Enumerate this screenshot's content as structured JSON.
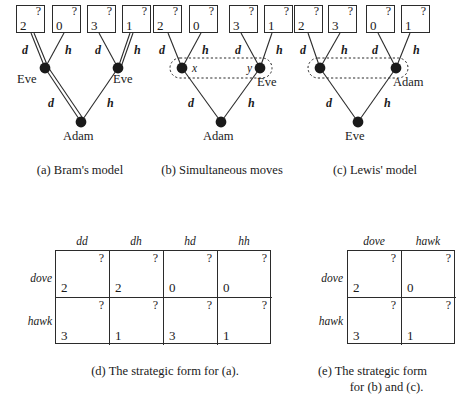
{
  "figure": {
    "trees": [
      {
        "id": "brams-model",
        "caption": "(a) Bram's model",
        "payoffs": [
          {
            "question": "?",
            "value": "2"
          },
          {
            "question": "?",
            "value": "0"
          },
          {
            "question": "?",
            "value": "3"
          },
          {
            "question": "?",
            "value": "1"
          }
        ],
        "edge_labels": [
          "d",
          "h",
          "d",
          "h"
        ],
        "root_edge_labels": [
          "d",
          "h"
        ],
        "upper_node_labels": [
          "Eve",
          "Eve"
        ],
        "root_node_label": "Adam",
        "information_set": false,
        "iset_labels": []
      },
      {
        "id": "simultaneous-moves",
        "caption": "(b) Simultaneous moves",
        "payoffs": [
          {
            "question": "?",
            "value": "2"
          },
          {
            "question": "?",
            "value": "0"
          },
          {
            "question": "?",
            "value": "3"
          },
          {
            "question": "?",
            "value": "1"
          }
        ],
        "edge_labels": [
          "d",
          "h",
          "d",
          "h"
        ],
        "root_edge_labels": [
          "d",
          "h"
        ],
        "upper_node_labels": [
          "",
          "Eve"
        ],
        "root_node_label": "Adam",
        "information_set": true,
        "iset_labels": [
          "x",
          "y"
        ]
      },
      {
        "id": "lewis-model",
        "caption": "(c) Lewis' model",
        "payoffs": [
          {
            "question": "?",
            "value": "2"
          },
          {
            "question": "?",
            "value": "3"
          },
          {
            "question": "?",
            "value": "0"
          },
          {
            "question": "?",
            "value": "1"
          }
        ],
        "edge_labels": [
          "d",
          "h",
          "d",
          "h"
        ],
        "root_edge_labels": [
          "d",
          "h"
        ],
        "upper_node_labels": [
          "",
          "Adam"
        ],
        "root_node_label": "Eve",
        "information_set": true,
        "iset_labels": []
      }
    ],
    "matrices": [
      {
        "id": "strategic-form-a",
        "caption": "(d) The strategic form for (a).",
        "col_headers": [
          "dd",
          "dh",
          "hd",
          "hh"
        ],
        "row_headers": [
          "dove",
          "hawk"
        ],
        "cells": [
          [
            {
              "question": "?",
              "value": "2"
            },
            {
              "question": "?",
              "value": "2"
            },
            {
              "question": "?",
              "value": "0"
            },
            {
              "question": "?",
              "value": "0"
            }
          ],
          [
            {
              "question": "?",
              "value": "3"
            },
            {
              "question": "?",
              "value": "1"
            },
            {
              "question": "?",
              "value": "3"
            },
            {
              "question": "?",
              "value": "1"
            }
          ]
        ]
      },
      {
        "id": "strategic-form-bc",
        "caption": "(e) The strategic form  for (b) and (c).",
        "caption_line1": "(e) The strategic form",
        "caption_line2": "for (b) and (c).",
        "col_headers": [
          "dove",
          "hawk"
        ],
        "row_headers": [
          "dove",
          "hawk"
        ],
        "cells": [
          [
            {
              "question": "?",
              "value": "2"
            },
            {
              "question": "?",
              "value": "0"
            }
          ],
          [
            {
              "question": "?",
              "value": "3"
            },
            {
              "question": "?",
              "value": "1"
            }
          ]
        ]
      }
    ],
    "colors": {
      "ink": "#1a1a1a",
      "line": "#2b2b2b",
      "node_fill": "#1a1a1a",
      "background": "#ffffff"
    }
  }
}
